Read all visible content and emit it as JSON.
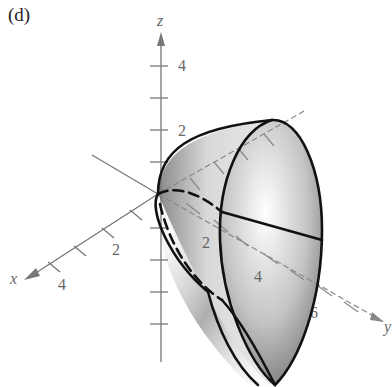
{
  "figure": {
    "panel_label": "(d)",
    "axes": {
      "z": {
        "label": "z",
        "tick_labels": [
          "2",
          "4"
        ]
      },
      "x": {
        "label": "x",
        "tick_labels": [
          "2",
          "4"
        ]
      },
      "y": {
        "label": "y",
        "tick_labels": [
          "2",
          "4",
          "6"
        ]
      }
    },
    "surface": "shaded paraboloid-shaped solid opening along the y-axis with elliptical cross-section",
    "colors": {
      "axis": "#777777",
      "curve": "#111111",
      "shade_dark": "#6e6e6e",
      "shade_light": "#f4f4f4"
    }
  }
}
